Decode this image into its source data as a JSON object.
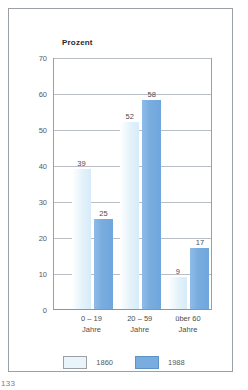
{
  "page": {
    "page_number": "133"
  },
  "chart_data": {
    "type": "bar",
    "title": "Prozent",
    "xlabel": "",
    "ylabel": "Prozent",
    "ylim": [
      0,
      70
    ],
    "yticks": [
      0,
      10,
      20,
      30,
      40,
      50,
      60,
      70
    ],
    "ytick_labels": [
      "0",
      "10",
      "20",
      "30",
      "40",
      "50",
      "60",
      "70"
    ],
    "grid": true,
    "legend_position": "bottom",
    "categories": [
      "0 – 19\nJahre",
      "20 – 59\nJahre",
      "über 60\nJahre"
    ],
    "category_lines": [
      [
        "0 – 19",
        "Jahre"
      ],
      [
        "20 – 59",
        "Jahre"
      ],
      [
        "über 60",
        "Jahre"
      ]
    ],
    "series": [
      {
        "name": "1860",
        "color": "#e9f5fb",
        "values": [
          39,
          52,
          9
        ],
        "value_labels": [
          "39",
          "52",
          "9"
        ]
      },
      {
        "name": "1988",
        "color": "#79ade0",
        "values": [
          25,
          58,
          17
        ],
        "value_labels": [
          "25",
          "58",
          "17"
        ]
      }
    ]
  }
}
